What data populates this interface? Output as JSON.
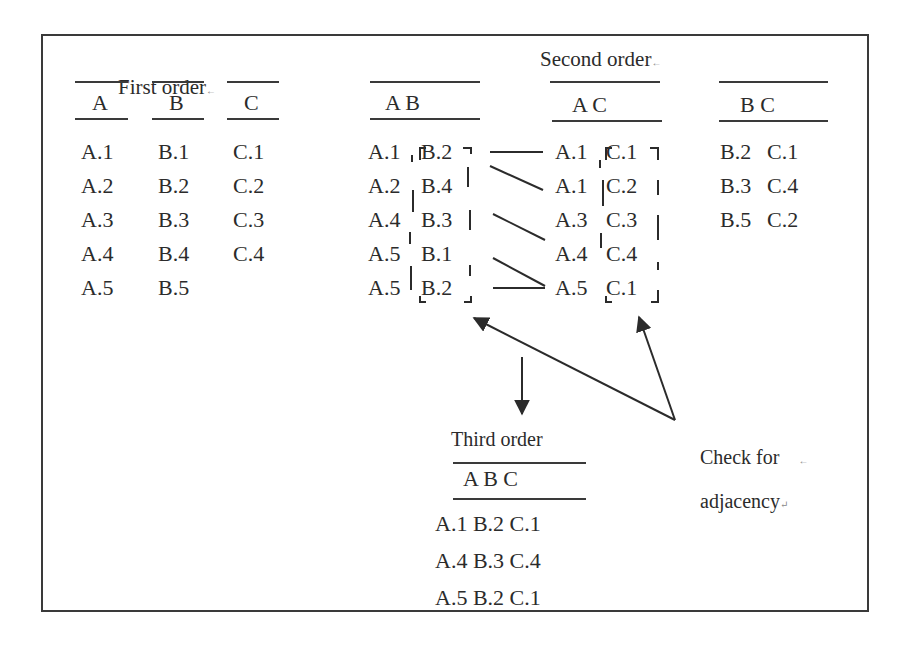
{
  "first_order": {
    "title": "First order",
    "title_mark": "←",
    "columns": [
      {
        "header": "A",
        "values": [
          "A.1",
          "A.2",
          "A.3",
          "A.4",
          "A.5"
        ]
      },
      {
        "header": "B",
        "values": [
          "B.1",
          "B.2",
          "B.3",
          "B.4",
          "B.5"
        ]
      },
      {
        "header": "C",
        "values": [
          "C.1",
          "C.2",
          "C.3",
          "C.4"
        ]
      }
    ]
  },
  "second_order": {
    "title": "Second order",
    "title_mark": "←",
    "tables": [
      {
        "header": "A B",
        "rows": [
          [
            "A.1",
            "B.2"
          ],
          [
            "A.2",
            "B.4"
          ],
          [
            "A.4",
            "B.3"
          ],
          [
            "A.5",
            "B.1"
          ],
          [
            "A.5",
            "B.2"
          ]
        ]
      },
      {
        "header": "A C",
        "rows": [
          [
            "A.1",
            "C.1"
          ],
          [
            "A.1",
            "C.2"
          ],
          [
            "A.3",
            "C.3"
          ],
          [
            "A.4",
            "C.4"
          ],
          [
            "A.5",
            "C.1"
          ]
        ]
      },
      {
        "header": "B C",
        "rows": [
          [
            "B.2",
            "C.1"
          ],
          [
            "B.3",
            "C.4"
          ],
          [
            "B.5",
            "C.2"
          ]
        ]
      }
    ]
  },
  "third_order": {
    "title": "Third order",
    "header": "A B C",
    "rows": [
      "A.1 B.2 C.1",
      "A.4 B.3 C.4",
      "A.5 B.2 C.1"
    ]
  },
  "annotation": {
    "line1": "Check for",
    "line1_mark": "←",
    "line2": "adjacency",
    "line2_mark": "↵"
  },
  "colors": {
    "ink": "#2b2b2b",
    "frame": "#3a3a3a",
    "background": "#ffffff"
  }
}
